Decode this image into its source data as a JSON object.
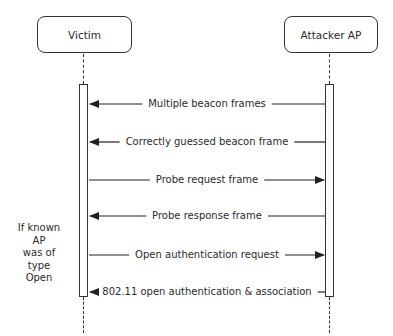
{
  "actors": {
    "victim": {
      "label": "Victim"
    },
    "attacker": {
      "label": "Attacker AP"
    }
  },
  "messages": [
    {
      "label": "Multiple beacon frames",
      "direction": "attacker-to-victim",
      "y": 104
    },
    {
      "label": "Correctly guessed beacon frame",
      "direction": "attacker-to-victim",
      "y": 142
    },
    {
      "label": "Probe request frame",
      "direction": "victim-to-attacker",
      "y": 180
    },
    {
      "label": "Probe response frame",
      "direction": "attacker-to-victim",
      "y": 216
    },
    {
      "label": "Open authentication request",
      "direction": "victim-to-attacker",
      "y": 255
    },
    {
      "label": "802.11 open authentication & association",
      "direction": "attacker-to-victim",
      "y": 292
    }
  ],
  "note": {
    "line1": "If known AP",
    "line2": "was of type",
    "line3": "Open"
  }
}
